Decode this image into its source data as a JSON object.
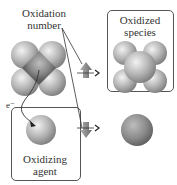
{
  "labels": {
    "oxidation_number_line1": "Oxidation",
    "oxidation_number_line2": "number",
    "oxidized_species_line1": "Oxidized",
    "oxidized_species_line2": "species",
    "oxidizing_agent_line1": "Oxidizing",
    "oxidizing_agent_line2": "agent",
    "electron": "e⁻"
  },
  "colors": {
    "sphere_light": "#e6e6e6",
    "sphere_mid": "#aaaaaa",
    "sphere_dark": "#6e6e6e",
    "arrow_gray": "#888888",
    "outline": "#555555"
  }
}
